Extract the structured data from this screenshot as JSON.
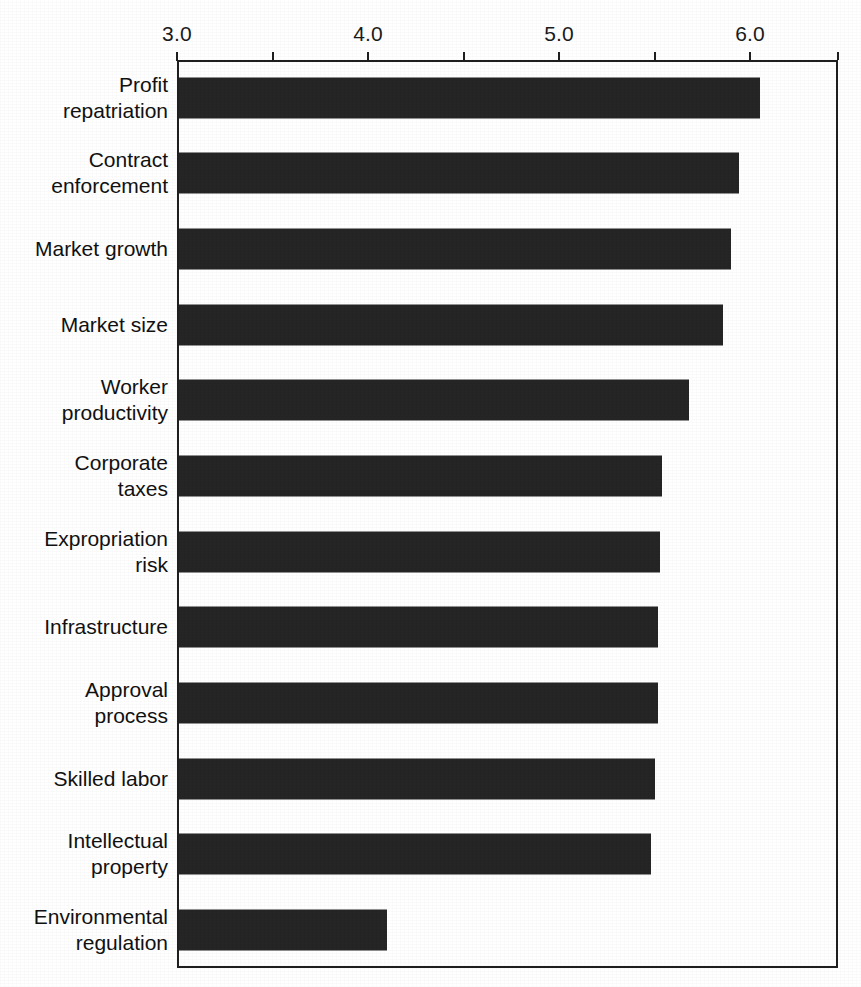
{
  "chart_data": {
    "type": "bar",
    "orientation": "horizontal",
    "title": "",
    "subtitle": "",
    "xlabel": "",
    "ylabel": "",
    "xlim": [
      3.0,
      6.46
    ],
    "grid": false,
    "legend": null,
    "axis": {
      "tick_labels": [
        "3.0",
        "4.0",
        "5.0",
        "6.0"
      ],
      "tick_values": [
        3.0,
        4.0,
        5.0,
        6.0
      ],
      "minor_tick_values": [
        3.5,
        4.5,
        5.5,
        6.0,
        6.46
      ],
      "all_tick_values": [
        3.0,
        3.5,
        4.0,
        4.5,
        5.0,
        5.5,
        6.0,
        6.46
      ],
      "position": "top"
    },
    "bar_color": "#252525",
    "frame_color": "#1f1f1f",
    "background_color": "#ffffff",
    "categories": [
      "Profit\nrepatriation",
      "Contract\nenforcement",
      "Market growth",
      "Market size",
      "Worker\nproductivity",
      "Corporate\ntaxes",
      "Expropriation\nrisk",
      "Infrastructure",
      "Approval\nprocess",
      "Skilled labor",
      "Intellectual\nproperty",
      "Environmental\nregulation"
    ],
    "values": [
      6.05,
      5.94,
      5.9,
      5.86,
      5.68,
      5.54,
      5.53,
      5.52,
      5.52,
      5.5,
      5.48,
      4.1
    ]
  }
}
